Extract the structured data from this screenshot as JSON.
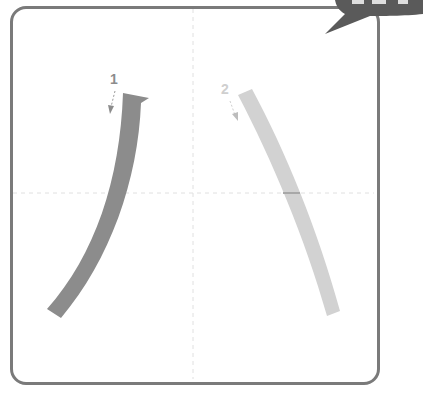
{
  "character": {
    "glyph": "八",
    "stroke_count": 2
  },
  "strokes": [
    {
      "order": "1",
      "label": "1",
      "color": "#8c8c8c",
      "type": "pie (left-falling)"
    },
    {
      "order": "2",
      "label": "2",
      "color": "#d2d2d2",
      "type": "na (right-falling)"
    }
  ],
  "grid": {
    "guide_color": "#dddddd",
    "border_color": "#7a7a7a"
  },
  "badge": {
    "color": "#5a5a5a"
  }
}
